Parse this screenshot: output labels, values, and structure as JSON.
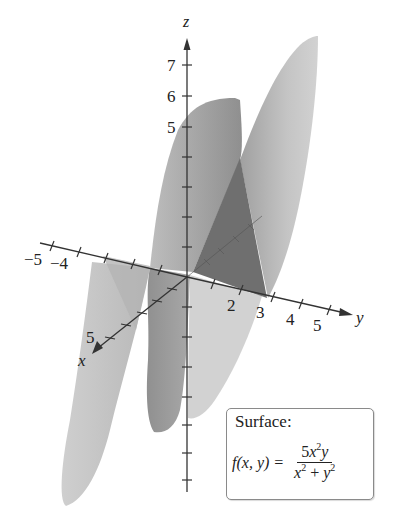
{
  "figure": {
    "axes": {
      "z": {
        "label": "z",
        "tick_labels": [
          "5",
          "6",
          "7"
        ]
      },
      "y": {
        "label": "y",
        "tick_labels": [
          "2",
          "3",
          "4",
          "5"
        ],
        "negative_tick_labels": [
          "−5",
          "−4"
        ]
      },
      "x": {
        "label": "x",
        "tick_labels": [
          "5"
        ]
      }
    },
    "colors": {
      "surface_light": "#c9c9c9",
      "surface_mid": "#a5a5a5",
      "surface_dark": "#6e6e6e",
      "axis": "#333333",
      "box_border": "#8a8a8a"
    }
  },
  "info_box": {
    "title": "Surface:",
    "lhs": "f(x, y) =",
    "numerator": {
      "coef": "5",
      "var1": "x",
      "exp1": "2",
      "var2": "y"
    },
    "denominator": {
      "var1": "x",
      "exp1": "2",
      "plus": " + ",
      "var2": "y",
      "exp2": "2"
    }
  }
}
